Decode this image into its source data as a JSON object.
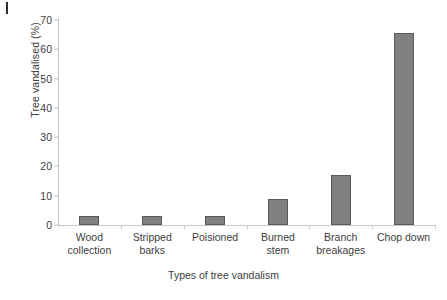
{
  "artifact": {
    "top_left_mark": "scan-tick-mark"
  },
  "chart_data": {
    "type": "bar",
    "title": "",
    "xlabel": "Types of tree vandalism",
    "ylabel": "Tree vandalised (%)",
    "categories": [
      "Wood collection",
      "Stripped barks",
      "Poisioned",
      "Burned stem",
      "Branch breakages",
      "Chop down"
    ],
    "category_lines": [
      [
        "Wood",
        "collection"
      ],
      [
        "Stripped",
        "barks"
      ],
      [
        "Poisioned",
        ""
      ],
      [
        "Burned",
        "stem"
      ],
      [
        "Branch",
        "breakages"
      ],
      [
        "Chop down",
        ""
      ]
    ],
    "values": [
      3,
      3,
      3,
      8.8,
      17,
      65.5
    ],
    "ylim": [
      0,
      70
    ],
    "yticks": [
      0,
      10,
      20,
      30,
      40,
      50,
      60,
      70
    ],
    "ytick_labels": [
      "0",
      "10",
      "20",
      "30",
      "40",
      "50",
      "60",
      "70"
    ],
    "grid": false,
    "legend": "none",
    "bar_color": "#808080",
    "bar_border_color": "#5a5a5a",
    "axis_color": "#c4c4c4",
    "text_color": "#3d3d3d"
  }
}
